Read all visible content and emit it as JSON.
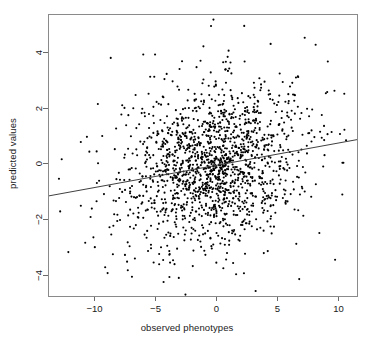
{
  "chart_data": {
    "type": "scatter",
    "title": "",
    "xlabel": "observed phenotypes",
    "ylabel": "predicted values",
    "xlim": [
      -13.8,
      11.6
    ],
    "ylim": [
      -4.75,
      5.35
    ],
    "xticks": [
      -10,
      -5,
      0,
      5,
      10
    ],
    "xtick_labels": [
      "−10",
      "−5",
      "0",
      "5",
      "10"
    ],
    "yticks": [
      -4,
      -2,
      0,
      2,
      4
    ],
    "ytick_labels": [
      "−4",
      "−2",
      "0",
      "2",
      "4"
    ],
    "grid": false,
    "legend": null,
    "point_color": "#000000",
    "point_size_px": 2.1,
    "n_points": 1600,
    "marker": "filled-circle",
    "regression_line": {
      "label": "fitted regression line",
      "color": "#404040",
      "width_px": 1,
      "x_start": -13.8,
      "y_start": -1.17,
      "x_end": 11.6,
      "y_end": 0.85,
      "slope": 0.0795,
      "intercept": -0.073
    },
    "scatter_model": {
      "description": "bivariate cloud, positive correlation",
      "x_mean": -0.2,
      "x_sd": 3.6,
      "y_mean": -0.06,
      "y_sd": 1.42,
      "correlation": 0.2,
      "seed": 20240517
    },
    "outlier_points": [
      [
        -12.9,
        -0.55
      ],
      [
        -12.8,
        -1.72
      ],
      [
        -10.6,
        0.95
      ],
      [
        -10.4,
        0.42
      ],
      [
        -10.3,
        -1.92
      ],
      [
        -9.6,
        -0.62
      ],
      [
        -9.2,
        -1.1
      ],
      [
        -9.1,
        -3.72
      ],
      [
        -8.9,
        -3.93
      ],
      [
        -8.6,
        -2.55
      ],
      [
        -8.2,
        1.25
      ],
      [
        -7.7,
        2.08
      ],
      [
        -7.3,
        -3.52
      ],
      [
        -6.9,
        -4.06
      ],
      [
        -6.6,
        2.45
      ],
      [
        -6.1,
        1.8
      ],
      [
        -5.4,
        3.1
      ],
      [
        -5.0,
        3.9
      ],
      [
        -4.3,
        -4.25
      ],
      [
        -3.4,
        -3.61
      ],
      [
        -2.5,
        -4.7
      ],
      [
        -1.9,
        -3.68
      ],
      [
        -0.2,
        5.15
      ],
      [
        -0.4,
        4.92
      ],
      [
        0.6,
        3.62
      ],
      [
        0.8,
        -4.78
      ],
      [
        1.1,
        3.4
      ],
      [
        4.5,
        4.28
      ],
      [
        7.3,
        4.5
      ],
      [
        8.2,
        4.25
      ],
      [
        9.2,
        3.65
      ],
      [
        9.8,
        -3.45
      ],
      [
        10.4,
        0.02
      ],
      [
        10.2,
        1.05
      ]
    ]
  },
  "plot_box": {
    "left_px": 48,
    "top_px": 14,
    "right_px": 357,
    "bottom_px": 296,
    "border_color": "#8a8a8a",
    "background": "#ffffff"
  }
}
